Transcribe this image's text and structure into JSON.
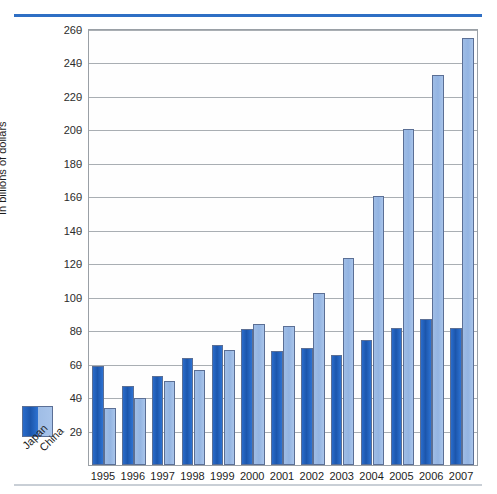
{
  "chart_data": {
    "type": "bar",
    "title": "",
    "xlabel": "",
    "ylabel": "In billions of dollars",
    "ylim": [
      0,
      260
    ],
    "ytick_step": 20,
    "yticks": [
      20,
      40,
      60,
      80,
      100,
      120,
      140,
      160,
      180,
      200,
      220,
      240,
      260
    ],
    "grid": true,
    "legend_position": "bottom-left-outside",
    "categories": [
      "1995",
      "1996",
      "1997",
      "1998",
      "1999",
      "2000",
      "2001",
      "2002",
      "2003",
      "2004",
      "2005",
      "2006",
      "2007"
    ],
    "series": [
      {
        "name": "Japan",
        "color": "#1c56ac",
        "values": [
          59,
          47,
          53,
          64,
          72,
          81,
          68,
          70,
          66,
          75,
          82,
          87,
          82
        ]
      },
      {
        "name": "China",
        "color": "#9fbde6",
        "values": [
          34,
          40,
          50,
          57,
          69,
          84,
          83,
          103,
          124,
          161,
          201,
          233,
          255
        ]
      }
    ]
  },
  "legend": {
    "items": [
      {
        "label": "Japan",
        "color": "#1c56ac"
      },
      {
        "label": "China",
        "color": "#9fbde6"
      }
    ]
  },
  "colors": {
    "top_rule": "#2f6fc4",
    "bottom_rule": "#c9cfd6",
    "gridline": "#a9aeb3",
    "axis": "#9aa0a6",
    "text": "#1d1d1d"
  }
}
